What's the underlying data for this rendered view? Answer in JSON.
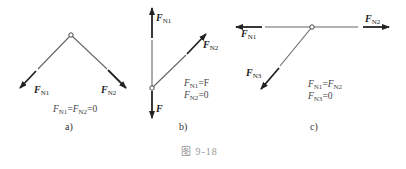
{
  "figure": {
    "caption": "图  9-18",
    "panels": [
      {
        "id": "a",
        "label": "a)",
        "forces": [
          {
            "name": "F",
            "sub": "N1"
          },
          {
            "name": "F",
            "sub": "N2"
          }
        ],
        "equations": [
          {
            "parts": [
              {
                "v": "F",
                "s": "N1"
              },
              {
                "op": "="
              },
              {
                "v": "F",
                "s": "N2"
              },
              {
                "op": "=0"
              }
            ]
          }
        ],
        "equation_text": [
          "FN1=FN2=0"
        ]
      },
      {
        "id": "b",
        "label": "b)",
        "forces": [
          {
            "name": "F",
            "sub": "N1"
          },
          {
            "name": "F",
            "sub": "N2"
          },
          {
            "name": "F",
            "sub": ""
          }
        ],
        "equation_text": [
          "FN1=F",
          "FN2=0"
        ]
      },
      {
        "id": "c",
        "label": "c)",
        "forces": [
          {
            "name": "F",
            "sub": "N1"
          },
          {
            "name": "F",
            "sub": "N2"
          },
          {
            "name": "F",
            "sub": "N3"
          }
        ],
        "equation_text": [
          "FN1=FN2",
          "FN3=0"
        ]
      }
    ]
  },
  "labels": {
    "a_fn1_sub": "N1",
    "a_fn2_sub": "N2",
    "a_eq_1": "N1",
    "a_eq_2": "N2",
    "a_eq_tail": "=0",
    "a_caption": "a)",
    "b_fn1_sub": "N1",
    "b_fn2_sub": "N2",
    "b_f": "F",
    "b_eq1_sub": "N1",
    "b_eq1_rhs": "=F",
    "b_eq2_sub": "N2",
    "b_eq2_rhs": "=0",
    "b_caption": "b)",
    "c_fn1_sub": "N1",
    "c_fn2_sub": "N2",
    "c_fn3_sub": "N3",
    "c_eq1_sub_a": "N1",
    "c_eq1_sub_b": "N2",
    "c_eq2_sub": "N3",
    "c_eq2_rhs": "=0",
    "c_caption": "c)",
    "F": "F",
    "eq": "=",
    "fig_caption": "图  9-18"
  },
  "colors": {
    "line": "#555555",
    "arrow": "#222222"
  }
}
